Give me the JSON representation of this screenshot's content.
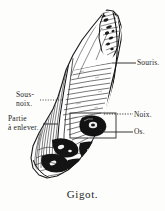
{
  "figure": {
    "caption": "Gigot.",
    "background_color": "#fdfdfc",
    "ink_color": "#1a1a1a"
  },
  "labels": {
    "souris": {
      "text": "Souris.",
      "side": "right",
      "leader": "solid"
    },
    "noix": {
      "text": "Noix.",
      "side": "right",
      "leader": "dotted"
    },
    "os": {
      "text": "Os.",
      "side": "right",
      "leader": "solid"
    },
    "sous_noix": {
      "line1": "Sous-",
      "line2": "noix.",
      "side": "left",
      "leader": "dotted"
    },
    "partie_a_enlever": {
      "line1": "Partie",
      "line2": "à enlever.",
      "side": "left",
      "leader": "solid"
    }
  },
  "icons": {
    "leader_line": "leader-line",
    "meat_outline": "meat-outline-icon",
    "bone_icon": "bone-icon"
  }
}
